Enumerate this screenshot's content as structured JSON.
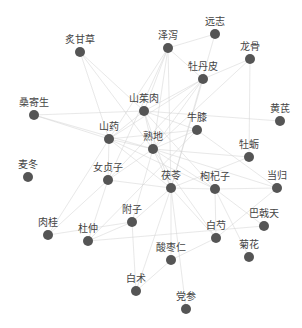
{
  "graph": {
    "type": "force-network",
    "node_color": "#555555",
    "label_color": "#444444",
    "edge_color": "#d4d4d4",
    "nodes": [
      {
        "id": "炙甘草",
        "x": 80,
        "y": 52
      },
      {
        "id": "泽泻",
        "x": 168,
        "y": 48
      },
      {
        "id": "远志",
        "x": 215,
        "y": 34
      },
      {
        "id": "龙骨",
        "x": 250,
        "y": 59
      },
      {
        "id": "牡丹皮",
        "x": 203,
        "y": 79
      },
      {
        "id": "桑寄生",
        "x": 34,
        "y": 115
      },
      {
        "id": "山茱肉",
        "x": 144,
        "y": 111
      },
      {
        "id": "黄芪",
        "x": 280,
        "y": 121
      },
      {
        "id": "牛膝",
        "x": 197,
        "y": 130
      },
      {
        "id": "山药",
        "x": 109,
        "y": 139
      },
      {
        "id": "熟地",
        "x": 153,
        "y": 149
      },
      {
        "id": "牡蛎",
        "x": 249,
        "y": 157
      },
      {
        "id": "麦冬",
        "x": 28,
        "y": 177
      },
      {
        "id": "女贞子",
        "x": 108,
        "y": 180
      },
      {
        "id": "茯苓",
        "x": 171,
        "y": 188
      },
      {
        "id": "枸杞子",
        "x": 215,
        "y": 189
      },
      {
        "id": "当归",
        "x": 277,
        "y": 188
      },
      {
        "id": "附子",
        "x": 132,
        "y": 222
      },
      {
        "id": "巴戟天",
        "x": 264,
        "y": 226
      },
      {
        "id": "肉桂",
        "x": 48,
        "y": 235
      },
      {
        "id": "杜仲",
        "x": 88,
        "y": 241
      },
      {
        "id": "白芍",
        "x": 216,
        "y": 238
      },
      {
        "id": "酸枣仁",
        "x": 171,
        "y": 260
      },
      {
        "id": "菊花",
        "x": 249,
        "y": 257
      },
      {
        "id": "白术",
        "x": 136,
        "y": 291
      },
      {
        "id": "党参",
        "x": 186,
        "y": 309
      }
    ],
    "edges": [
      [
        "熟地",
        "山茱肉"
      ],
      [
        "熟地",
        "山药"
      ],
      [
        "熟地",
        "泽泻"
      ],
      [
        "熟地",
        "牡丹皮"
      ],
      [
        "熟地",
        "茯苓"
      ],
      [
        "熟地",
        "枸杞子"
      ],
      [
        "熟地",
        "牛膝"
      ],
      [
        "熟地",
        "女贞子"
      ],
      [
        "熟地",
        "当归"
      ],
      [
        "熟地",
        "牡蛎"
      ],
      [
        "熟地",
        "炙甘草"
      ],
      [
        "熟地",
        "附子"
      ],
      [
        "熟地",
        "白芍"
      ],
      [
        "熟地",
        "桑寄生"
      ],
      [
        "熟地",
        "龙骨"
      ],
      [
        "山茱肉",
        "山药"
      ],
      [
        "山茱肉",
        "泽泻"
      ],
      [
        "山茱肉",
        "牡丹皮"
      ],
      [
        "山茱肉",
        "茯苓"
      ],
      [
        "山茱肉",
        "炙甘草"
      ],
      [
        "山茱肉",
        "枸杞子"
      ],
      [
        "山茱肉",
        "牛膝"
      ],
      [
        "山茱肉",
        "桑寄生"
      ],
      [
        "山茱肉",
        "黄芪"
      ],
      [
        "山药",
        "泽泻"
      ],
      [
        "山药",
        "牡丹皮"
      ],
      [
        "山药",
        "茯苓"
      ],
      [
        "山药",
        "女贞子"
      ],
      [
        "山药",
        "桑寄生"
      ],
      [
        "山药",
        "肉桂"
      ],
      [
        "山药",
        "枸杞子"
      ],
      [
        "山药",
        "炙甘草"
      ],
      [
        "山药",
        "牛膝"
      ],
      [
        "泽泻",
        "牡丹皮"
      ],
      [
        "泽泻",
        "茯苓"
      ],
      [
        "泽泻",
        "女贞子"
      ],
      [
        "泽泻",
        "远志"
      ],
      [
        "牡丹皮",
        "茯苓"
      ],
      [
        "牡丹皮",
        "龙骨"
      ],
      [
        "牡丹皮",
        "女贞子"
      ],
      [
        "茯苓",
        "枸杞子"
      ],
      [
        "茯苓",
        "白术"
      ],
      [
        "茯苓",
        "酸枣仁"
      ],
      [
        "茯苓",
        "白芍"
      ],
      [
        "茯苓",
        "附子"
      ],
      [
        "茯苓",
        "远志"
      ],
      [
        "茯苓",
        "党参"
      ],
      [
        "茯苓",
        "女贞子"
      ],
      [
        "枸杞子",
        "菊花"
      ],
      [
        "枸杞子",
        "巴戟天"
      ],
      [
        "枸杞子",
        "当归"
      ],
      [
        "枸杞子",
        "白芍"
      ],
      [
        "龙骨",
        "牡蛎"
      ],
      [
        "牡蛎",
        "茯苓"
      ],
      [
        "当归",
        "白芍"
      ],
      [
        "当归",
        "牛膝"
      ],
      [
        "女贞子",
        "杜仲"
      ],
      [
        "女贞子",
        "肉桂"
      ],
      [
        "附子",
        "肉桂"
      ],
      [
        "附子",
        "白术"
      ],
      [
        "附子",
        "杜仲"
      ],
      [
        "牛膝",
        "杜仲"
      ],
      [
        "白芍",
        "酸枣仁"
      ],
      [
        "酸枣仁",
        "白术"
      ],
      [
        "巴戟天",
        "杜仲"
      ]
    ]
  }
}
